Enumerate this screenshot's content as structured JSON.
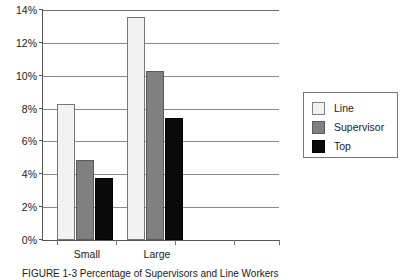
{
  "chart_data": {
    "type": "bar",
    "title": "",
    "xlabel": "",
    "ylabel": "",
    "categories": [
      "Small",
      "Large"
    ],
    "series": [
      {
        "name": "Line",
        "values": [
          8.3,
          13.6
        ],
        "color": "#f2f2f2"
      },
      {
        "name": "Supervisor",
        "values": [
          4.9,
          10.3
        ],
        "color": "#808080"
      },
      {
        "name": "Top",
        "values": [
          3.8,
          7.4
        ],
        "color": "#0a0a0a"
      }
    ],
    "ylim": [
      0,
      14
    ],
    "ytick_values": [
      0,
      2,
      4,
      6,
      8,
      10,
      12,
      14
    ],
    "ytick_labels": [
      "0%",
      "2%",
      "4%",
      "6%",
      "8%",
      "10%",
      "12%",
      "14%"
    ],
    "value_format": "percent",
    "grid": true,
    "grid_axis": "y",
    "legend_position": "right",
    "empty_category_slots": 2
  },
  "axis": {
    "y_labels": [
      "14%",
      "12%",
      "10%",
      "8%",
      "6%",
      "4%",
      "2%",
      "0%"
    ],
    "x_labels": [
      "Small",
      "Large"
    ]
  },
  "legend": {
    "entries": [
      {
        "label": "Line"
      },
      {
        "label": "Supervisor"
      },
      {
        "label": "Top"
      }
    ]
  },
  "caption": {
    "text": "FIGURE 1-3   Percentage of Supervisors and Line Workers"
  }
}
